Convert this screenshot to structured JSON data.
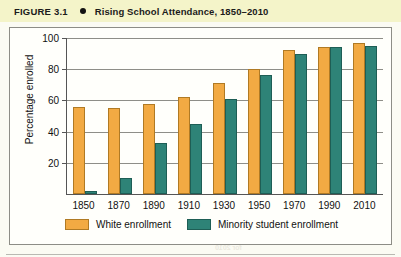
{
  "header": {
    "figure_label": "FIGURE 3.1",
    "bullet_icon": "bullet-dot-icon",
    "title": "Rising School Attendance, 1850–2010",
    "band_color": "#f4f4c9"
  },
  "colors": {
    "white_enrollment": "#f2aa43",
    "minority_enrollment": "#2e8377",
    "axis": "#555555",
    "gridline": "#8e8e88",
    "page_background": "#fbfbf3"
  },
  "chart_data": {
    "type": "bar",
    "title": "Rising School Attendance, 1850–2010",
    "xlabel": "",
    "ylabel": "Percentage enrolled",
    "categories": [
      "1850",
      "1870",
      "1890",
      "1910",
      "1930",
      "1950",
      "1970",
      "1990",
      "2010"
    ],
    "series": [
      {
        "name": "White enrollment",
        "color": "#f2aa43",
        "values": [
          56,
          55,
          58,
          62,
          71,
          80,
          92,
          94,
          97
        ]
      },
      {
        "name": "Minority student enrollment",
        "color": "#2e8377",
        "values": [
          2,
          10,
          33,
          45,
          61,
          76,
          90,
          94,
          95
        ]
      }
    ],
    "ylim": [
      0,
      100
    ],
    "yticks": [
      20,
      40,
      60,
      80,
      100
    ],
    "ytick_labels": [
      "20",
      "40",
      "60",
      "80",
      "100"
    ],
    "grid": true,
    "legend_position": "bottom"
  },
  "legend": {
    "items": [
      {
        "label": "White enrollment",
        "color": "#f2aa43"
      },
      {
        "label": "Minority student enrollment",
        "color": "#2e8377"
      }
    ]
  },
  "page_bleed": {
    "lines": [
      "cent Future E",
      "ten Futu",
      "and school",
      "from the",
      "1980",
      "for 2010"
    ]
  }
}
